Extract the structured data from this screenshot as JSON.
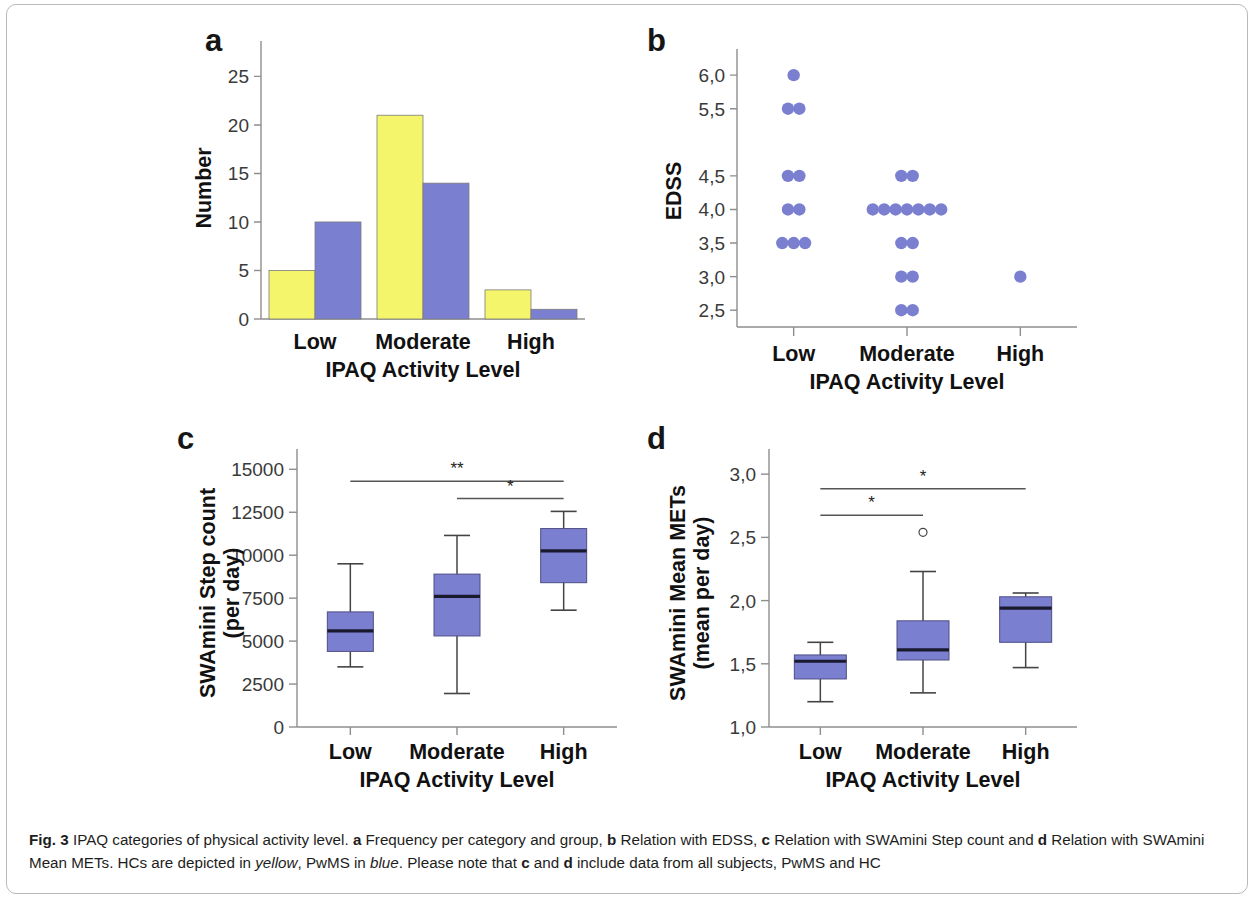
{
  "figure": {
    "label": "Fig. 3",
    "caption_parts": [
      {
        "t": "IPAQ categories of physical activity level. ",
        "s": "normal"
      },
      {
        "t": "a",
        "s": "bold"
      },
      {
        "t": " Frequency per category and group, ",
        "s": "normal"
      },
      {
        "t": "b",
        "s": "bold"
      },
      {
        "t": " Relation with EDSS, ",
        "s": "normal"
      },
      {
        "t": "c",
        "s": "bold"
      },
      {
        "t": " Relation with SWAmini Step count and ",
        "s": "normal"
      },
      {
        "t": "d",
        "s": "bold"
      },
      {
        "t": " Relation with SWAmini Mean METs. HCs are depicted in ",
        "s": "normal"
      },
      {
        "t": "yellow",
        "s": "italic"
      },
      {
        "t": ", PwMS in ",
        "s": "normal"
      },
      {
        "t": "blue",
        "s": "italic"
      },
      {
        "t": ". Please note that ",
        "s": "normal"
      },
      {
        "t": "c",
        "s": "bold"
      },
      {
        "t": " and ",
        "s": "normal"
      },
      {
        "t": "d",
        "s": "bold"
      },
      {
        "t": " include data from all subjects, PwMS and HC",
        "s": "normal"
      }
    ]
  },
  "colors": {
    "hc_yellow": "#f5f56b",
    "pwms_blue": "#7b7fd0",
    "box_fill": "#7b7fd0",
    "axis_gray": "#8e8e8e",
    "text_dark": "#161616",
    "frame_gray": "#b9b9b9"
  },
  "panels": {
    "a": {
      "letter": "a"
    },
    "b": {
      "letter": "b"
    },
    "c": {
      "letter": "c"
    },
    "d": {
      "letter": "d"
    }
  },
  "chart_data": [
    {
      "panel": "a",
      "type": "bar",
      "title": "Frequency per category and group",
      "xlabel": "IPAQ Activity Level",
      "ylabel": "Number",
      "categories": [
        "Low",
        "Moderate",
        "High"
      ],
      "yticks": [
        0,
        5,
        10,
        15,
        20,
        25
      ],
      "ytick_labels": [
        "0",
        "5",
        "10",
        "15",
        "20",
        "25"
      ],
      "ylim": [
        0,
        27
      ],
      "grid": false,
      "legend": "none",
      "series": [
        {
          "name": "HC",
          "color": "#f5f56b",
          "values": [
            5,
            21,
            3
          ]
        },
        {
          "name": "PwMS",
          "color": "#7b7fd0",
          "values": [
            10,
            14,
            1
          ]
        }
      ]
    },
    {
      "panel": "b",
      "type": "scatter",
      "title": "Relation with EDSS",
      "xlabel": "IPAQ Activity Level",
      "ylabel": "EDSS",
      "categories": [
        "Low",
        "Moderate",
        "High"
      ],
      "yticks": [
        2.5,
        3.0,
        3.5,
        4.0,
        4.5,
        5.0,
        5.5,
        6.0
      ],
      "ytick_labels": [
        "2,5",
        "3,0",
        "3,5",
        "4,0",
        "4,5",
        "",
        "5,5",
        "6,0"
      ],
      "ylim": [
        2.25,
        6.3
      ],
      "grid": false,
      "marker": "filled-circle",
      "marker_color": "#7b7fd0",
      "groups": [
        {
          "category": "Low",
          "stacks": [
            {
              "value": 6.0,
              "count": 1
            },
            {
              "value": 5.5,
              "count": 2
            },
            {
              "value": 4.5,
              "count": 2
            },
            {
              "value": 4.0,
              "count": 2
            },
            {
              "value": 3.5,
              "count": 3
            }
          ]
        },
        {
          "category": "Moderate",
          "stacks": [
            {
              "value": 4.5,
              "count": 2
            },
            {
              "value": 4.0,
              "count": 7
            },
            {
              "value": 3.5,
              "count": 2
            },
            {
              "value": 3.0,
              "count": 2
            },
            {
              "value": 2.5,
              "count": 2
            }
          ]
        },
        {
          "category": "High",
          "stacks": [
            {
              "value": 3.0,
              "count": 1
            }
          ]
        }
      ]
    },
    {
      "panel": "c",
      "type": "box",
      "title": "Relation with SWAmini Step count",
      "xlabel": "IPAQ Activity Level",
      "ylabel": "SWAmini Step count (per day)",
      "ylabel_line1": "SWAmini Step count",
      "ylabel_line2": "(per day)",
      "categories": [
        "Low",
        "Moderate",
        "High"
      ],
      "yticks": [
        0,
        2500,
        5000,
        7500,
        10000,
        12500,
        15000
      ],
      "ytick_labels": [
        "0",
        "2500",
        "5000",
        "7500",
        "10000",
        "12500",
        "15000"
      ],
      "ylim": [
        0,
        15600
      ],
      "grid": false,
      "boxes": [
        {
          "category": "Low",
          "min": 3500,
          "q1": 4400,
          "median": 5600,
          "q3": 6700,
          "max": 9500,
          "outliers": []
        },
        {
          "category": "Moderate",
          "min": 1950,
          "q1": 5300,
          "median": 7600,
          "q3": 8900,
          "max": 11150,
          "outliers": []
        },
        {
          "category": "High",
          "min": 6800,
          "q1": 8400,
          "median": 10250,
          "q3": 11550,
          "max": 12550,
          "outliers": []
        }
      ],
      "significance": [
        {
          "from": "Low",
          "to": "High",
          "marker": "**",
          "level": 14300
        },
        {
          "from": "Moderate",
          "to": "High",
          "marker": "*",
          "level": 13300
        }
      ]
    },
    {
      "panel": "d",
      "type": "box",
      "title": "Relation with SWAmini Mean METs",
      "xlabel": "IPAQ Activity Level",
      "ylabel": "SWAmini Mean METs (mean per day)",
      "ylabel_line1": "SWAmini Mean METs",
      "ylabel_line2": "(mean per day)",
      "categories": [
        "Low",
        "Moderate",
        "High"
      ],
      "yticks": [
        1.0,
        1.5,
        2.0,
        2.5,
        3.0
      ],
      "ytick_labels": [
        "1,0",
        "1,5",
        "2,0",
        "2,5",
        "3,0"
      ],
      "ylim": [
        1.0,
        3.12
      ],
      "grid": false,
      "boxes": [
        {
          "category": "Low",
          "min": 1.2,
          "q1": 1.38,
          "median": 1.52,
          "q3": 1.57,
          "max": 1.67,
          "outliers": []
        },
        {
          "category": "Moderate",
          "min": 1.27,
          "q1": 1.53,
          "median": 1.61,
          "q3": 1.84,
          "max": 2.23,
          "outliers": [
            2.54
          ]
        },
        {
          "category": "High",
          "min": 1.47,
          "q1": 1.67,
          "median": 1.94,
          "q3": 2.03,
          "max": 2.06,
          "outliers": []
        }
      ],
      "significance": [
        {
          "from": "Low",
          "to": "High",
          "marker": "*",
          "level": 2.885
        },
        {
          "from": "Low",
          "to": "Moderate",
          "marker": "*",
          "level": 2.675
        }
      ]
    }
  ]
}
